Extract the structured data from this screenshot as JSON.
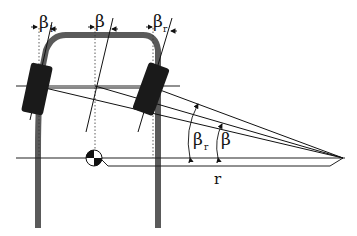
{
  "diagram": {
    "type": "vehicle-steering-geometry",
    "labels": {
      "beta_left_top": "β",
      "beta_left_sub": "l",
      "beta_center_top": "β",
      "beta_right_top": "β",
      "beta_right_sub": "r",
      "beta_r_angle": "β",
      "beta_r_angle_sub": "r",
      "beta_angle": "β",
      "radius": "r"
    },
    "colors": {
      "ink": "#111111",
      "frame": "#555555",
      "tire": "#1a1a1a",
      "background": "#ffffff"
    }
  }
}
